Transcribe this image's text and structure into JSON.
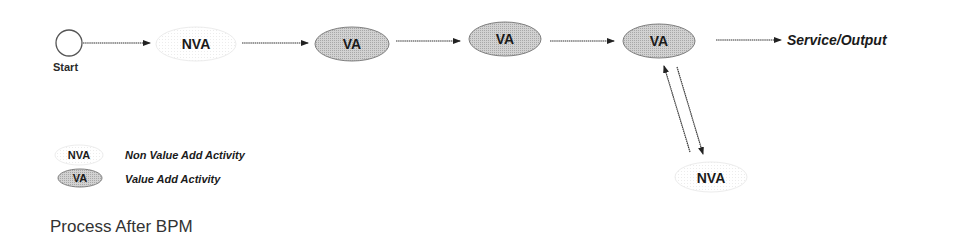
{
  "diagram": {
    "title": "Process After BPM",
    "colors": {
      "va_fill": "#c6c6c6",
      "va_stroke": "#7a7a7a",
      "nva_fill": "#fbfbfb",
      "nva_stroke": "#e6e6e6",
      "line": "#333333",
      "text": "#1a1a1a"
    },
    "start": {
      "label": "Start"
    },
    "nodes": [
      {
        "id": "n1",
        "type": "NVA",
        "label": "NVA"
      },
      {
        "id": "n2",
        "type": "VA",
        "label": "VA"
      },
      {
        "id": "n3",
        "type": "VA",
        "label": "VA"
      },
      {
        "id": "n4",
        "type": "VA",
        "label": "VA"
      },
      {
        "id": "n5",
        "type": "NVA",
        "label": "NVA"
      }
    ],
    "output": {
      "label": "Service/Output"
    },
    "edges": [
      {
        "from": "start",
        "to": "n1"
      },
      {
        "from": "n1",
        "to": "n2"
      },
      {
        "from": "n2",
        "to": "n3"
      },
      {
        "from": "n3",
        "to": "n4"
      },
      {
        "from": "n4",
        "to": "output"
      },
      {
        "from": "n5",
        "to": "n4"
      },
      {
        "from": "n4",
        "to": "n5"
      }
    ],
    "legend": [
      {
        "symbol": "NVA",
        "description": "Non Value Add Activity"
      },
      {
        "symbol": "VA",
        "description": "Value Add Activity"
      }
    ]
  }
}
